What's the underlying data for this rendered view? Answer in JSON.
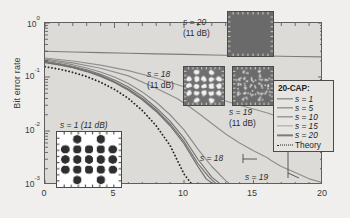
{
  "chart_data": {
    "type": "line",
    "title": "",
    "xlabel": "",
    "ylabel": "Bit error rate",
    "xlim": [
      0,
      20
    ],
    "ylim": [
      0.001,
      1
    ],
    "yscale": "log",
    "xticks": [
      0,
      5,
      10,
      15,
      20
    ],
    "xtick_labels": [
      "0",
      "5",
      "10",
      "15",
      "20"
    ],
    "ytick_labels": [
      "10",
      "10",
      "10",
      "10"
    ],
    "ytick_exponents": [
      "0",
      "-1",
      "-2",
      "-3"
    ],
    "ytick_values": [
      1,
      0.1,
      0.01,
      0.001
    ],
    "grid": false,
    "legend_position": "right",
    "legend_title": "20-CAP:",
    "series": [
      {
        "name": "s = 1",
        "color": "#6b6b6b",
        "style": "solid",
        "x": [
          0,
          1,
          2,
          3,
          4,
          5,
          6,
          7,
          8,
          9,
          10,
          11,
          11.6,
          12.2
        ],
        "y": [
          0.185,
          0.168,
          0.148,
          0.126,
          0.102,
          0.079,
          0.057,
          0.038,
          0.023,
          0.0125,
          0.0058,
          0.0022,
          0.0013,
          0.001
        ]
      },
      {
        "name": "s = 5",
        "color": "#6f6f6f",
        "style": "solid",
        "x": [
          0,
          1,
          2,
          3,
          4,
          5,
          6,
          7,
          8,
          9,
          10,
          11,
          11.8,
          12.4
        ],
        "y": [
          0.19,
          0.172,
          0.152,
          0.13,
          0.106,
          0.082,
          0.06,
          0.04,
          0.0245,
          0.0135,
          0.0064,
          0.0025,
          0.0014,
          0.001
        ]
      },
      {
        "name": "s = 10",
        "color": "#757575",
        "style": "solid",
        "x": [
          0,
          1,
          2,
          3,
          4,
          5,
          6,
          7,
          8,
          9,
          10,
          11,
          12,
          12.7
        ],
        "y": [
          0.195,
          0.178,
          0.158,
          0.136,
          0.112,
          0.088,
          0.065,
          0.044,
          0.027,
          0.0152,
          0.0074,
          0.003,
          0.0014,
          0.001
        ]
      },
      {
        "name": "s = 15",
        "color": "#8a8a8a",
        "style": "solid",
        "x": [
          0,
          1,
          2,
          3,
          4,
          5,
          6,
          7,
          8,
          9,
          10,
          11,
          12,
          13,
          13.4
        ],
        "y": [
          0.205,
          0.188,
          0.169,
          0.147,
          0.124,
          0.1,
          0.076,
          0.053,
          0.034,
          0.02,
          0.0105,
          0.0046,
          0.0022,
          0.0012,
          0.001
        ]
      },
      {
        "name": "s = 18",
        "color": "#8e8e8e",
        "style": "solid",
        "x": [
          0,
          2,
          4,
          6,
          8,
          9.5,
          10.5,
          11.3,
          12,
          13,
          14,
          15,
          16,
          16.3,
          17,
          18,
          19,
          20
        ],
        "y": [
          0.215,
          0.183,
          0.145,
          0.105,
          0.062,
          0.04,
          0.027,
          0.019,
          0.0138,
          0.0088,
          0.006,
          0.0043,
          0.0032,
          0.0028,
          0.0022,
          0.0017,
          0.0013,
          0.0011
        ]
      },
      {
        "name": "s = 19",
        "color": "#909090",
        "style": "solid",
        "x": [
          0,
          2,
          4,
          6,
          8,
          10,
          11,
          12,
          13,
          14,
          15,
          16,
          17,
          18,
          19,
          20
        ],
        "y": [
          0.225,
          0.198,
          0.166,
          0.131,
          0.096,
          0.066,
          0.054,
          0.044,
          0.036,
          0.03,
          0.0255,
          0.0215,
          0.0175,
          0.014,
          0.0112,
          0.0092
        ]
      },
      {
        "name": "s = 20",
        "color": "#7c7c7c",
        "style": "solid",
        "x": [
          0,
          2,
          4,
          6,
          8,
          10,
          12,
          14,
          16,
          18,
          20
        ],
        "y": [
          0.3,
          0.29,
          0.282,
          0.275,
          0.268,
          0.262,
          0.255,
          0.25,
          0.245,
          0.24,
          0.235
        ]
      },
      {
        "name": "Theory",
        "color": "#222222",
        "style": "dotted",
        "x": [
          0,
          1,
          2,
          3,
          4,
          5,
          6,
          7,
          8,
          9,
          10,
          10.6
        ],
        "y": [
          0.155,
          0.14,
          0.122,
          0.102,
          0.08,
          0.059,
          0.04,
          0.024,
          0.0125,
          0.0054,
          0.0016,
          0.001
        ]
      }
    ],
    "legend_entries": [
      {
        "label": "s = 1",
        "color": "#6b6b6b",
        "style": "solid",
        "italic": true
      },
      {
        "label": "s = 5",
        "color": "#6f6f6f",
        "style": "solid",
        "italic": true
      },
      {
        "label": "s = 10",
        "color": "#757575",
        "style": "solid",
        "italic": true
      },
      {
        "label": "s = 15",
        "color": "#8a8a8a",
        "style": "solid",
        "italic": true
      },
      {
        "label": "s = 20",
        "color": "#7c7c7c",
        "style": "solid",
        "italic": true
      },
      {
        "label": "Theory",
        "color": "#222222",
        "style": "dotted",
        "italic": false
      }
    ],
    "curve_annotations": [
      {
        "name": "s = 18",
        "text": "s = 18"
      },
      {
        "name": "s = 19",
        "text": "s = 19"
      }
    ],
    "insets": [
      {
        "name": "s = 1 (11 dB)",
        "label": "s = 1 (11 dB)",
        "label_line1": "s = 1 (11 dB)",
        "label_line2": "",
        "background": "#ffffff",
        "point_color": "#303030",
        "spread": "tight"
      },
      {
        "name": "s = 18 (11 dB)",
        "label": "s = 18 (11 dB)",
        "label_line1": "s = 18",
        "label_line2": "(11 dB)",
        "background": "#6f6f6f",
        "point_color": "#f2f2f2",
        "spread": "medium"
      },
      {
        "name": "s = 19 (11 dB)",
        "label": "s = 19 (11 dB)",
        "label_line1": "s = 19",
        "label_line2": "(11 dB)",
        "background": "#6b6b6b",
        "point_color": "#e8e8e8",
        "spread": "wide"
      },
      {
        "name": "s = 20 (11 dB)",
        "label": "s = 20 (11 dB)",
        "label_line1": "s = 20",
        "label_line2": "(11 dB)",
        "background": "#6a6a6a",
        "point_color": "#6a6a6a",
        "spread": "saturated"
      }
    ]
  },
  "axes": {
    "ylabel": "Bit error rate",
    "ytick0": "10",
    "ytick0_exp": "0",
    "ytick1": "10",
    "ytick1_exp": "-1",
    "ytick2": "10",
    "ytick2_exp": "-2",
    "ytick3": "10",
    "ytick3_exp": "-3",
    "xtick0": "0",
    "xtick1": "5",
    "xtick2": "10",
    "xtick3": "15",
    "xtick4": "20"
  },
  "legend": {
    "title": "20-CAP:",
    "row0": "s = 1",
    "row1": "s = 5",
    "row2": "s = 10",
    "row3": "s = 15",
    "row4": "s = 20",
    "row5": "Theory"
  },
  "annotations": {
    "inset_s1": "s = 1 (11 dB)",
    "inset_s18_l1": "s = 18",
    "inset_s18_l2": "(11 dB)",
    "inset_s19_l1": "s = 19",
    "inset_s19_l2": "(11 dB)",
    "inset_s20_l1": "s = 20",
    "inset_s20_l2": "(11 dB)",
    "curve_s18": "s = 18",
    "curve_s19": "s = 19"
  }
}
